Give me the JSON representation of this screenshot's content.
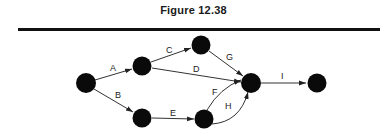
{
  "figure": {
    "title": "Figure 12.38"
  },
  "colors": {
    "node": "#0a0a0a",
    "edge": "#333333",
    "rule": "#111111"
  },
  "graph": {
    "nodes": [
      {
        "id": "n1",
        "x": 86,
        "y": 83
      },
      {
        "id": "n2",
        "x": 142,
        "y": 66
      },
      {
        "id": "n3",
        "x": 201,
        "y": 45
      },
      {
        "id": "n4",
        "x": 251,
        "y": 83
      },
      {
        "id": "n5",
        "x": 317,
        "y": 83
      },
      {
        "id": "n6",
        "x": 142,
        "y": 118
      },
      {
        "id": "n7",
        "x": 204,
        "y": 119
      }
    ],
    "edges": [
      {
        "label": "A",
        "from": "n1",
        "to": "n2"
      },
      {
        "label": "B",
        "from": "n1",
        "to": "n6"
      },
      {
        "label": "C",
        "from": "n2",
        "to": "n3"
      },
      {
        "label": "D",
        "from": "n2",
        "to": "n4"
      },
      {
        "label": "E",
        "from": "n6",
        "to": "n7"
      },
      {
        "label": "F",
        "from": "n7",
        "to": "n4"
      },
      {
        "label": "G",
        "from": "n3",
        "to": "n4"
      },
      {
        "label": "H",
        "from": "n7",
        "to": "n4"
      },
      {
        "label": "I",
        "from": "n4",
        "to": "n5"
      }
    ]
  }
}
